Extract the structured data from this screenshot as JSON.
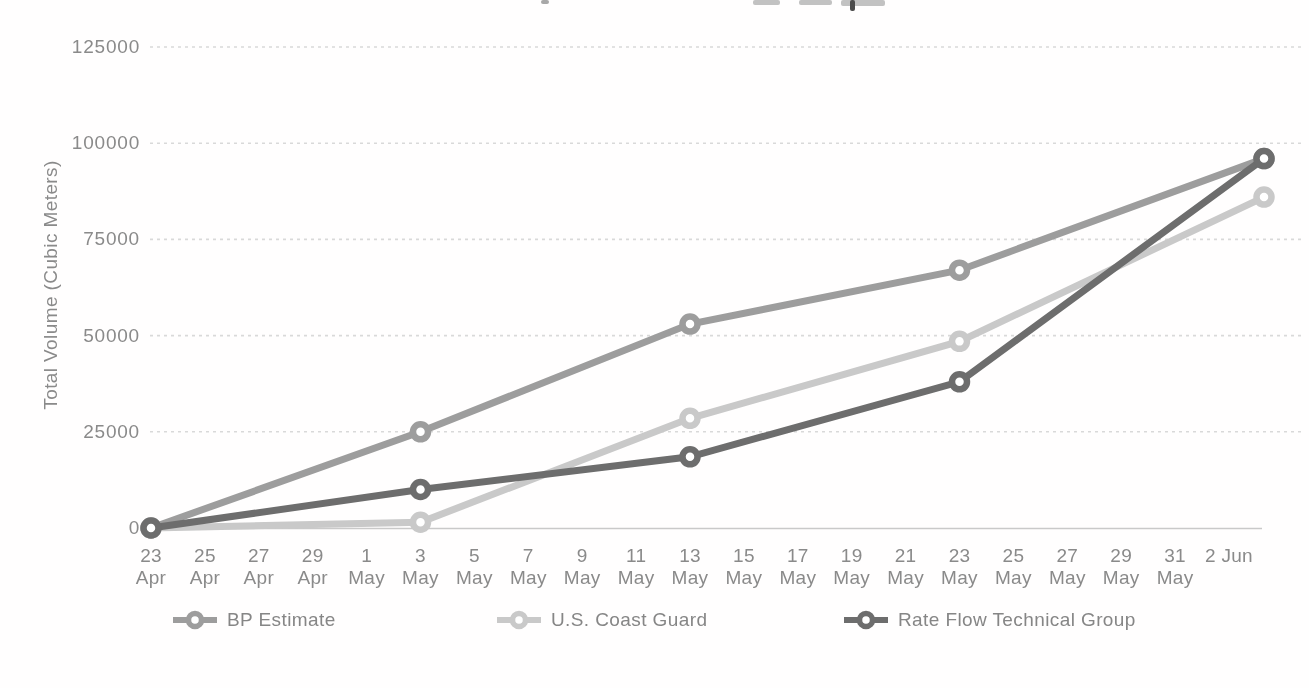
{
  "chart_data": {
    "type": "line",
    "title": "",
    "ylabel": "Total Volume (Cubic Meters)",
    "xlabel": "",
    "ylim": [
      0,
      125000
    ],
    "y_ticks": [
      0,
      25000,
      50000,
      75000,
      100000,
      125000
    ],
    "y_tick_labels": [
      "0",
      "25000",
      "50000",
      "75000",
      "100000",
      "125000"
    ],
    "categories": [
      "23 Apr",
      "25 Apr",
      "27 Apr",
      "29 Apr",
      "1 May",
      "3 May",
      "5 May",
      "7 May",
      "9 May",
      "11 May",
      "13 May",
      "15 May",
      "17 May",
      "19 May",
      "21 May",
      "23 May",
      "25 May",
      "27 May",
      "29 May",
      "31 May",
      "2 Jun"
    ],
    "grid": "horizontal-dashed",
    "legend_position": "bottom",
    "series": [
      {
        "name": "BP Estimate",
        "color": "#9d9d9d",
        "points": [
          {
            "category": "23 Apr",
            "value": 0
          },
          {
            "category": "3 May",
            "value": 25000
          },
          {
            "category": "13 May",
            "value": 53000
          },
          {
            "category": "23 May",
            "value": 67000
          },
          {
            "category": "2 Jun",
            "value": 96000
          }
        ]
      },
      {
        "name": "U.S. Coast Guard",
        "color": "#c9c9c9",
        "points": [
          {
            "category": "23 Apr",
            "value": 0
          },
          {
            "category": "3 May",
            "value": 1500
          },
          {
            "category": "13 May",
            "value": 28500
          },
          {
            "category": "23 May",
            "value": 48500
          },
          {
            "category": "2 Jun",
            "value": 86000
          }
        ]
      },
      {
        "name": "Rate Flow Technical Group",
        "color": "#6d6d6d",
        "points": [
          {
            "category": "23 Apr",
            "value": 0
          },
          {
            "category": "3 May",
            "value": 10000
          },
          {
            "category": "13 May",
            "value": 18500
          },
          {
            "category": "23 May",
            "value": 38000
          },
          {
            "category": "2 Jun",
            "value": 96000
          }
        ]
      }
    ],
    "colors": {
      "grid": "#d9d9d9",
      "axis": "#c9c9c9",
      "text": "#8a8a8a"
    }
  }
}
